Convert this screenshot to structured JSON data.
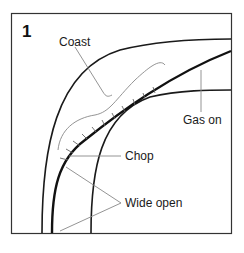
{
  "figure": {
    "panel_number": "1",
    "labels": {
      "coast": "Coast",
      "gas_on": "Gas on",
      "chop": "Chop",
      "wide_open": "Wide open"
    },
    "colors": {
      "stroke": "#1a1a1a",
      "thin_stroke": "#777777",
      "background": "#ffffff"
    }
  }
}
